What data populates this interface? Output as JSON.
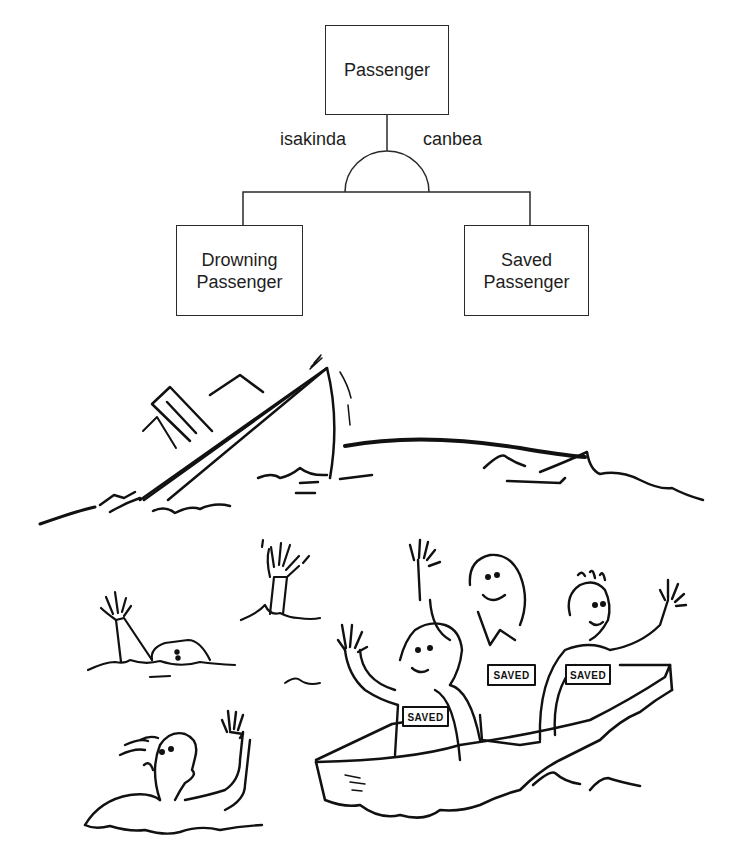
{
  "diagram": {
    "root": {
      "label": "Passenger"
    },
    "relation_left": "isakinda",
    "relation_right": "canbea",
    "children": [
      {
        "line1": "Drowning",
        "line2": "Passenger"
      },
      {
        "line1": "Saved",
        "line2": "Passenger"
      }
    ]
  },
  "illustration": {
    "scene": "sinking ship, drowning passengers, and saved passengers in a lifeboat",
    "badges": [
      "SAVED",
      "SAVED",
      "SAVED"
    ]
  }
}
